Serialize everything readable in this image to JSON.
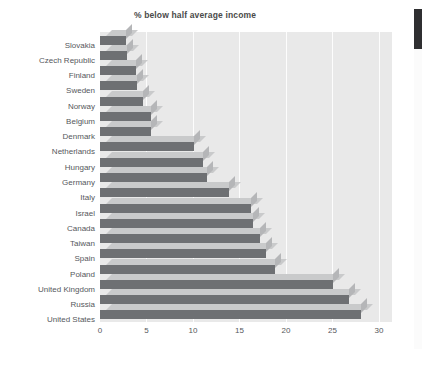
{
  "chart_data": {
    "type": "bar",
    "orientation": "horizontal",
    "title": "% below half average income",
    "xlabel": "",
    "ylabel": "",
    "xlim": [
      0,
      30
    ],
    "xticks": [
      0,
      5,
      10,
      15,
      20,
      25,
      30
    ],
    "grid": true,
    "legend": false,
    "style": "3d-horizontal-bar",
    "colors": {
      "bar_front": "#6e7073",
      "bar_top": "#c9cacb",
      "bar_side": "#b5b6b8",
      "plot_background": "#e9e9e9",
      "gridline": "#fdfdfd",
      "text": "#55585c",
      "title_text": "#4a4a4a",
      "marker": "#2f2f31"
    },
    "categories": [
      "Slovakia",
      "Czech Republic",
      "Finland",
      "Sweden",
      "Norway",
      "Belgium",
      "Denmark",
      "Netherlands",
      "Hungary",
      "Germany",
      "Italy",
      "Israel",
      "Canada",
      "Taiwan",
      "Spain",
      "Poland",
      "United Kingdom",
      "Russia",
      "United States"
    ],
    "values": [
      2.8,
      2.9,
      3.9,
      4.0,
      4.6,
      5.5,
      5.5,
      10.1,
      11.1,
      11.5,
      13.9,
      16.2,
      16.4,
      17.2,
      17.9,
      18.8,
      25.1,
      26.8,
      28.1
    ]
  }
}
